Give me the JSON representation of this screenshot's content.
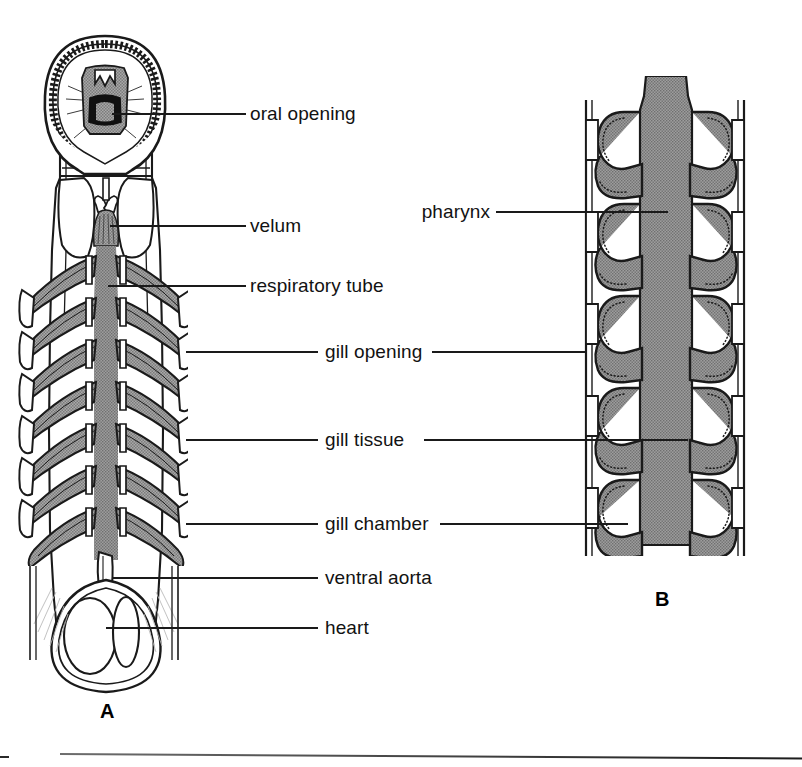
{
  "figure": {
    "title_fragment_top": ". .  .   .",
    "panels": [
      {
        "id": "A",
        "label": "A",
        "caption_position": "below-left"
      },
      {
        "id": "B",
        "label": "B",
        "caption_position": "below-right"
      }
    ]
  },
  "labels": {
    "oral_opening": "oral opening",
    "velum": "velum",
    "respiratory_tube": "respiratory tube",
    "gill_opening": "gill opening",
    "gill_tissue": "gill tissue",
    "gill_chamber": "gill chamber",
    "ventral_aorta": "ventral aorta",
    "heart": "heart",
    "pharynx": "pharynx"
  },
  "panel_a": {
    "name": "ventral dissection of lamprey gill basket",
    "structures": [
      "oral hood with papillae ring",
      "oral opening with teeth",
      "velum",
      "respiratory tube",
      "gill arches",
      "gill chambers",
      "ventral aorta",
      "heart"
    ],
    "gill_pair_count": 7
  },
  "panel_b": {
    "name": "horizontal section through pharynx and gill pouches",
    "structures": [
      "pharynx",
      "gill opening",
      "gill tissue",
      "gill chamber",
      "body wall"
    ],
    "gill_pair_count": 5
  },
  "colors": {
    "ink": "#121212",
    "paper": "#ffffff",
    "tissue_gray": "#9a9a9a",
    "tissue_gray_dark": "#7e7e7e",
    "leader_line": "#1a1a1a"
  }
}
